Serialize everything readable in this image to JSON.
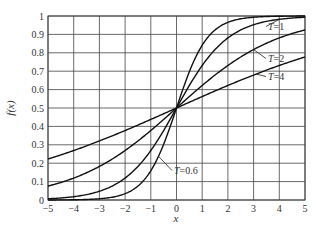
{
  "chart_data": {
    "type": "line",
    "title": "",
    "xlabel": "x",
    "ylabel": "f(x)",
    "xlim": [
      -5,
      5
    ],
    "ylim": [
      0,
      1
    ],
    "grid": true,
    "x_ticks": [
      -5,
      -4,
      -3,
      -2,
      -1,
      0,
      1,
      2,
      3,
      4,
      5
    ],
    "x_tick_labels": [
      "−5",
      "−4",
      "−3",
      "−2",
      "−1",
      "0",
      "1",
      "2",
      "3",
      "4",
      "5"
    ],
    "y_ticks": [
      0,
      0.1,
      0.2,
      0.3,
      0.4,
      0.5,
      0.6,
      0.7,
      0.8,
      0.9,
      1
    ],
    "y_tick_labels": [
      "0",
      "0.1",
      "0.2",
      "0.3",
      "0.4",
      "0.5",
      "0.6",
      "0.7",
      "0.8",
      "0.9",
      "1"
    ],
    "function": "f(x) = 1 / (1 + exp(-x / T))",
    "x": [
      -5,
      -4,
      -3,
      -2,
      -1,
      0,
      1,
      2,
      3,
      4,
      5
    ],
    "series": [
      {
        "name": "T=0.6",
        "T": 0.6,
        "label_prefix": "T",
        "label_suffix": "=0.6",
        "values": [
          0.0002,
          0.0013,
          0.0067,
          0.0344,
          0.1589,
          0.5,
          0.8411,
          0.9656,
          0.9933,
          0.9987,
          0.9998
        ]
      },
      {
        "name": "T=1",
        "T": 1,
        "label_prefix": "T",
        "label_suffix": "=1",
        "values": [
          0.0067,
          0.018,
          0.0474,
          0.1192,
          0.2689,
          0.5,
          0.7311,
          0.8808,
          0.9526,
          0.982,
          0.9933
        ]
      },
      {
        "name": "T=2",
        "T": 2,
        "label_prefix": "T",
        "label_suffix": "=2",
        "values": [
          0.0759,
          0.1192,
          0.1824,
          0.2689,
          0.3775,
          0.5,
          0.6225,
          0.7311,
          0.8176,
          0.8808,
          0.9241
        ]
      },
      {
        "name": "T=4",
        "T": 4,
        "label_prefix": "T",
        "label_suffix": "=4",
        "values": [
          0.2227,
          0.2689,
          0.3208,
          0.3775,
          0.4378,
          0.5,
          0.5622,
          0.6225,
          0.6792,
          0.7311,
          0.7773
        ]
      }
    ]
  }
}
